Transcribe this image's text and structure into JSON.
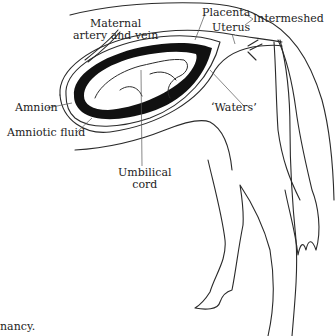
{
  "labels": {
    "maternal": [
      "Maternal",
      "artery and vein"
    ],
    "placenta": "Placenta",
    "uterus": "Uterus",
    "intermeshed": "Intermeshed",
    "amnion": "Amnion",
    "amniotic_fluid": "Amniotic fluid",
    "waters": "‘Waters’",
    "umbilical": [
      "Umbilical",
      "cord"
    ]
  },
  "caption_fragment": "nancy.",
  "colors": {
    "line": "#2a2a2a",
    "fill": "#111111",
    "background": "#ffffff"
  }
}
